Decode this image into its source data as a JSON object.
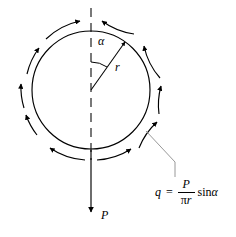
{
  "figure": {
    "background_color": "#ffffff",
    "line_color": "#000000",
    "leader_color": "#8c8c8c"
  },
  "geometry": {
    "circle_center_x": 91,
    "circle_center_y": 90,
    "circle_radius": 59,
    "arrow_ring_radius": 70,
    "centerline_top_y": 8,
    "centerline_bottom_y": 214,
    "angle_alpha_degrees": 35
  },
  "labels": {
    "alpha": "α",
    "radius": "r",
    "force": "P"
  },
  "formula": {
    "lhs": "q",
    "equals": "=",
    "numerator": "P",
    "denominator_pi": "π",
    "denominator_r": "r",
    "trig_function": "sin",
    "trig_argument": "α",
    "plain_text": "q = P/(πr) sin α"
  },
  "annotations": {
    "shear_flow_direction": "arrows along circumference directed toward top of circle",
    "load_direction": "downward vertical force P applied along centerline"
  }
}
